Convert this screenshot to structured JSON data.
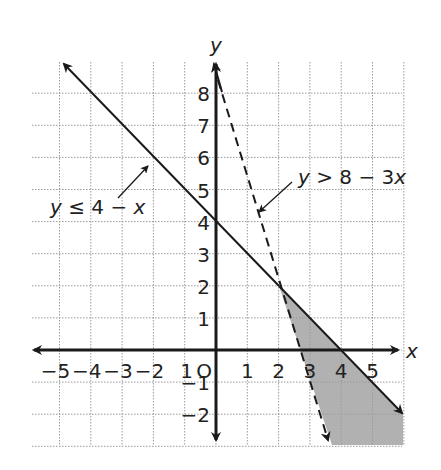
{
  "chart_data": {
    "type": "line",
    "title": "",
    "xlabel": "x",
    "ylabel": "y",
    "xlim": [
      -6,
      6
    ],
    "ylim": [
      -3,
      9
    ],
    "grid": true,
    "x_ticks": [
      "-5",
      "-4",
      "-3",
      "-2",
      "1",
      "0",
      "1",
      "2",
      "3",
      "4",
      "5"
    ],
    "x_tick_labels": [
      {
        "text": "−5",
        "v": -5
      },
      {
        "text": "−4",
        "v": -4
      },
      {
        "text": "−3",
        "v": -3
      },
      {
        "text": "−2",
        "v": -2
      },
      {
        "text": "1",
        "v": -1
      },
      {
        "text": "O",
        "v": 0
      },
      {
        "text": "1",
        "v": 1
      },
      {
        "text": "2",
        "v": 2
      },
      {
        "text": "3",
        "v": 3
      },
      {
        "text": "4",
        "v": 4
      },
      {
        "text": "5",
        "v": 5
      }
    ],
    "y_tick_labels": [
      {
        "text": "8",
        "v": 8
      },
      {
        "text": "7",
        "v": 7
      },
      {
        "text": "6",
        "v": 6
      },
      {
        "text": "5",
        "v": 5
      },
      {
        "text": "4",
        "v": 4
      },
      {
        "text": "3",
        "v": 3
      },
      {
        "text": "2",
        "v": 2
      },
      {
        "text": "1",
        "v": 1
      },
      {
        "text": "−1",
        "v": -1
      },
      {
        "text": "−2",
        "v": -2
      }
    ],
    "series": [
      {
        "name": "y ≤ 4 − x",
        "style": "solid",
        "equation": "y = 4 - x",
        "points": [
          [
            -5,
            9
          ],
          [
            6,
            -2
          ]
        ]
      },
      {
        "name": "y > 8 − 3x",
        "style": "dashed",
        "equation": "y = 8 - 3x",
        "points": [
          [
            0,
            8
          ],
          [
            3.6,
            -2.8
          ]
        ]
      }
    ],
    "shaded_region": {
      "description": "solution region y <= 4 - x and y > 8 - 3x",
      "vertices": [
        [
          2,
          2
        ],
        [
          6,
          -2
        ],
        [
          6,
          -3
        ],
        [
          3.67,
          -3
        ]
      ],
      "color": "#a6a6a6"
    },
    "annotations": [
      {
        "text": "y ≤ 4 − x",
        "points_to": [
          -2,
          6
        ]
      },
      {
        "text": "y > 8 − 3x",
        "points_to": [
          1.3,
          4.2
        ]
      }
    ]
  },
  "labels": {
    "axis_x": "x",
    "axis_y": "y",
    "eq1_y": "y",
    "eq1_rest": " ≤ 4 − ",
    "eq1_x": "x",
    "eq2_y": "y",
    "eq2_rest": " > 8 − 3",
    "eq2_x": "x"
  },
  "colors": {
    "grid": "#9a9a9a",
    "axis": "#1a1a1a",
    "shade": "#a8a8a8"
  }
}
